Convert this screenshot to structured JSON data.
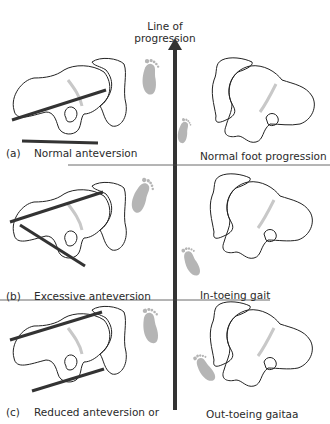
{
  "diagram": {
    "title_line1": "Line of",
    "title_line2": "progression",
    "rows": [
      {
        "letter": "(a)",
        "left_label": "Normal anteversion",
        "right_label": "Normal foot progression"
      },
      {
        "letter": "(b)",
        "left_label": "Excessive anteversion",
        "right_label": "In-toeing gait"
      },
      {
        "letter": "(c)",
        "left_label": "Reduced anteversion or",
        "right_label": "Out-toeing gaitaa"
      }
    ],
    "colors": {
      "outline": "#222222",
      "axis": "#333333",
      "footprint": "#b5b5b5",
      "growth_line": "#c8c8c8"
    }
  }
}
